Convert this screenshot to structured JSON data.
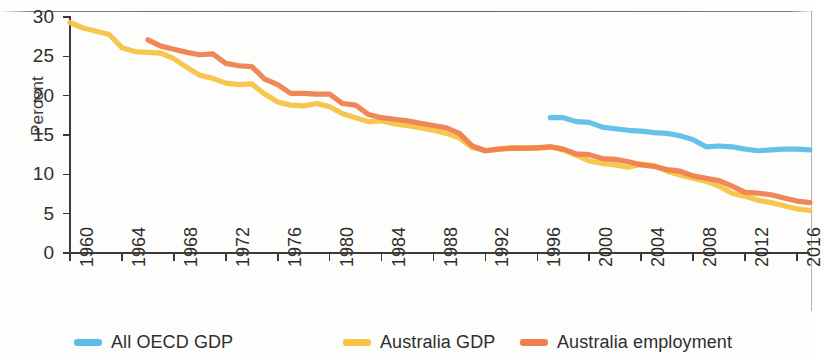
{
  "chart_data": {
    "type": "line",
    "title": "",
    "subtitle": "",
    "xlabel": "",
    "ylabel": "Percent",
    "xlim": [
      1960,
      2017
    ],
    "ylim": [
      0,
      30
    ],
    "grid": false,
    "legend_position": "bottom",
    "ytick_labels": [
      "0",
      "5",
      "10",
      "15",
      "20",
      "25",
      "30"
    ],
    "ytick_values": [
      0,
      5,
      10,
      15,
      20,
      25,
      30
    ],
    "xtick_labels": [
      "1960",
      "1964",
      "1968",
      "1972",
      "1976",
      "1980",
      "1984",
      "1988",
      "1992",
      "1996",
      "2000",
      "2004",
      "2008",
      "2012",
      "2016"
    ],
    "xtick_values": [
      1960,
      1964,
      1968,
      1972,
      1976,
      1980,
      1984,
      1988,
      1992,
      1996,
      2000,
      2004,
      2008,
      2012,
      2016
    ],
    "colors": {
      "all_oecd_gdp": "#5BBDE8",
      "australia_gdp": "#F7C245",
      "australia_employment": "#EE7F4F",
      "axis": "#3a3a3a",
      "text": "#2e2e2e"
    },
    "series": [
      {
        "name": "All OECD GDP",
        "color": "#5BBDE8",
        "x": [
          1997,
          1998,
          1999,
          2000,
          2001,
          2002,
          2003,
          2004,
          2005,
          2006,
          2007,
          2008,
          2009,
          2010,
          2011,
          2012,
          2013,
          2014,
          2015,
          2016,
          2017
        ],
        "values": [
          17.2,
          17.2,
          16.7,
          16.6,
          16.0,
          15.8,
          15.6,
          15.5,
          15.3,
          15.2,
          14.9,
          14.4,
          13.5,
          13.6,
          13.5,
          13.2,
          13.0,
          13.1,
          13.2,
          13.2,
          13.1
        ]
      },
      {
        "name": "Australia GDP",
        "color": "#F7C245",
        "x": [
          1960,
          1961,
          1962,
          1963,
          1964,
          1965,
          1966,
          1967,
          1968,
          1969,
          1970,
          1971,
          1972,
          1973,
          1974,
          1975,
          1976,
          1977,
          1978,
          1979,
          1980,
          1981,
          1982,
          1983,
          1984,
          1985,
          1986,
          1987,
          1988,
          1989,
          1990,
          1991,
          1992,
          1993,
          1994,
          1995,
          1996,
          1997,
          1998,
          1999,
          2000,
          2001,
          2002,
          2003,
          2004,
          2005,
          2006,
          2007,
          2008,
          2009,
          2010,
          2011,
          2012,
          2013,
          2014,
          2015,
          2016,
          2017
        ],
        "values": [
          29.3,
          28.6,
          28.2,
          27.8,
          26.1,
          25.6,
          25.5,
          25.4,
          24.7,
          23.6,
          22.6,
          22.2,
          21.6,
          21.4,
          21.5,
          20.2,
          19.2,
          18.8,
          18.7,
          19.0,
          18.6,
          17.7,
          17.2,
          16.7,
          16.8,
          16.4,
          16.2,
          15.9,
          15.6,
          15.2,
          14.6,
          13.4,
          13.0,
          13.2,
          13.4,
          13.4,
          13.3,
          13.5,
          13.1,
          12.4,
          11.7,
          11.4,
          11.2,
          10.9,
          11.3,
          11.1,
          10.4,
          9.9,
          9.5,
          9.1,
          8.5,
          7.6,
          7.2,
          6.7,
          6.4,
          6.0,
          5.6,
          5.4
        ]
      },
      {
        "name": "Australia employment",
        "color": "#EE7F4F",
        "x": [
          1966,
          1967,
          1968,
          1969,
          1970,
          1971,
          1972,
          1973,
          1974,
          1975,
          1976,
          1977,
          1978,
          1979,
          1980,
          1981,
          1982,
          1983,
          1984,
          1985,
          1986,
          1987,
          1988,
          1989,
          1990,
          1991,
          1992,
          1993,
          1994,
          1995,
          1996,
          1997,
          1998,
          1999,
          2000,
          2001,
          2002,
          2003,
          2004,
          2005,
          2006,
          2007,
          2008,
          2009,
          2010,
          2011,
          2012,
          2013,
          2014,
          2015,
          2016,
          2017
        ],
        "values": [
          27.1,
          26.3,
          25.9,
          25.5,
          25.2,
          25.3,
          24.1,
          23.8,
          23.7,
          22.1,
          21.4,
          20.3,
          20.3,
          20.2,
          20.2,
          19.0,
          18.8,
          17.6,
          17.2,
          17.0,
          16.8,
          16.5,
          16.2,
          15.9,
          15.2,
          13.6,
          13.0,
          13.2,
          13.3,
          13.3,
          13.4,
          13.5,
          13.2,
          12.6,
          12.5,
          12.0,
          11.9,
          11.6,
          11.2,
          11.0,
          10.6,
          10.4,
          9.8,
          9.5,
          9.2,
          8.5,
          7.7,
          7.6,
          7.4,
          7.0,
          6.6,
          6.4
        ]
      }
    ],
    "legend": [
      {
        "label": "All OECD GDP",
        "color": "#5BBDE8"
      },
      {
        "label": "Australia GDP",
        "color": "#F7C245"
      },
      {
        "label": "Australia employment",
        "color": "#EE7F4F"
      }
    ]
  }
}
